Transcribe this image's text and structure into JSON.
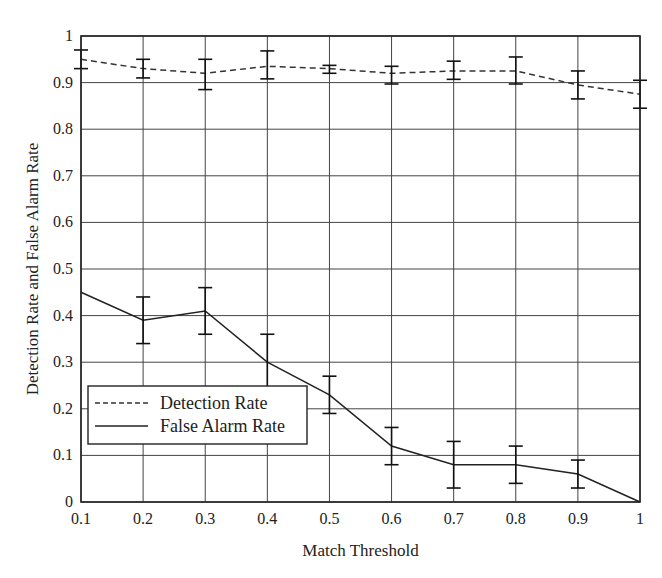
{
  "chart_data": {
    "type": "line",
    "title": "",
    "xlabel": "Match Threshold",
    "ylabel": "Detection Rate and False Alarm Rate",
    "xlim": [
      0.1,
      1.0
    ],
    "ylim": [
      0,
      1
    ],
    "grid": true,
    "legend_position": "lower left",
    "x": [
      0.1,
      0.2,
      0.3,
      0.4,
      0.5,
      0.6,
      0.7,
      0.8,
      0.9,
      1.0
    ],
    "x_tick_labels": [
      "0.1",
      "0.2",
      "0.3",
      "0.4",
      "0.5",
      "0.6",
      "0.7",
      "0.8",
      "0.9",
      "1"
    ],
    "y_ticks": [
      0,
      0.1,
      0.2,
      0.3,
      0.4,
      0.5,
      0.6,
      0.7,
      0.8,
      0.9,
      1
    ],
    "y_tick_labels": [
      "0",
      "0.1",
      "0.2",
      "0.3",
      "0.4",
      "0.5",
      "0.6",
      "0.7",
      "0.8",
      "0.9",
      "1"
    ],
    "series": [
      {
        "name": "Detection Rate",
        "style": "dashed",
        "color": "#333333",
        "values": [
          0.95,
          0.93,
          0.92,
          0.935,
          0.93,
          0.92,
          0.925,
          0.925,
          0.895,
          0.875
        ],
        "error_low": [
          0.93,
          0.91,
          0.885,
          0.908,
          0.92,
          0.897,
          0.907,
          0.897,
          0.865,
          0.845
        ],
        "error_high": [
          0.97,
          0.95,
          0.95,
          0.968,
          0.937,
          0.935,
          0.946,
          0.955,
          0.925,
          0.905
        ]
      },
      {
        "name": "False Alarm Rate",
        "style": "solid",
        "color": "#222222",
        "values": [
          0.45,
          0.39,
          0.41,
          0.3,
          0.23,
          0.12,
          0.08,
          0.08,
          0.06,
          0.0
        ],
        "error_low": [
          null,
          0.34,
          0.36,
          0.24,
          0.19,
          0.08,
          0.03,
          0.04,
          0.03,
          null
        ],
        "error_high": [
          null,
          0.44,
          0.46,
          0.36,
          0.27,
          0.16,
          0.13,
          0.12,
          0.09,
          null
        ]
      }
    ]
  }
}
